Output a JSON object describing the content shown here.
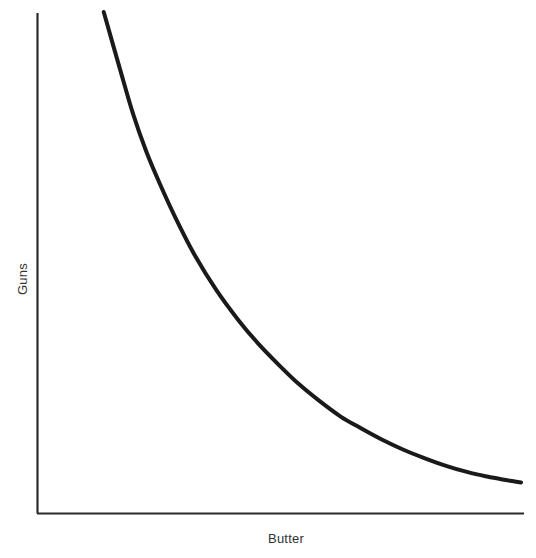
{
  "chart_data": {
    "type": "line",
    "title": "",
    "subtitle": "",
    "xlabel": "Butter",
    "ylabel": "Guns",
    "grid": false,
    "legend": null,
    "axis_ticks": {
      "x": [],
      "y": []
    },
    "xlim": [
      0,
      1
    ],
    "ylim": [
      0,
      1
    ],
    "annotations": [],
    "series": [
      {
        "name": "Production possibilities frontier",
        "shape": "convex-decreasing",
        "line_color": "#1a1a1a",
        "line_width": 4,
        "x": [
          0.137,
          0.17,
          0.198,
          0.225,
          0.253,
          0.287,
          0.325,
          0.37,
          0.416,
          0.457,
          0.499,
          0.54,
          0.583,
          0.627,
          0.669,
          0.712,
          0.757,
          0.8,
          0.845,
          0.89,
          0.93,
          0.962,
          0.987,
          1.0
        ],
        "y": [
          1.0,
          0.885,
          0.79,
          0.714,
          0.648,
          0.575,
          0.502,
          0.43,
          0.368,
          0.32,
          0.277,
          0.238,
          0.203,
          0.171,
          0.147,
          0.124,
          0.103,
          0.086,
          0.07,
          0.057,
          0.048,
          0.042,
          0.038,
          0.036
        ]
      }
    ]
  },
  "axes": {
    "y_axis_label": "Guns",
    "x_axis_label": "Butter",
    "axis_color": "#2b2b2b"
  },
  "colors": {
    "background": "#ffffff",
    "curve": "#1a1a1a",
    "axis": "#2b2b2b",
    "label_text": "#333333"
  }
}
